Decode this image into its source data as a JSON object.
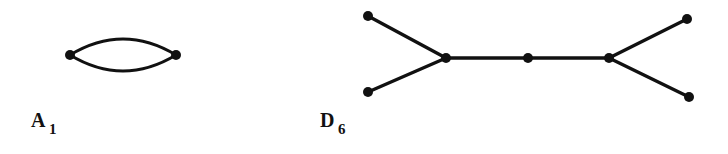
{
  "figure": {
    "background_color": "#ffffff",
    "ink_color": "#111111",
    "width": 728,
    "height": 154,
    "diagrams": [
      {
        "id": "a1",
        "label_base": "A",
        "label_subscript": "1",
        "label_text": "A1",
        "type": "lens-double-edge",
        "node_count": 2,
        "edge_count": 2,
        "nodes": [
          {
            "name": "a1-node-left",
            "x": 70,
            "y": 55
          },
          {
            "name": "a1-node-right",
            "x": 176,
            "y": 55
          }
        ],
        "edges": [
          {
            "name": "a1-edge-upper",
            "from": 0,
            "to": 1,
            "bow": -23
          },
          {
            "name": "a1-edge-lower",
            "from": 0,
            "to": 1,
            "bow": 23
          }
        ]
      },
      {
        "id": "d6",
        "label_base": "D",
        "label_subscript": "6",
        "label_text": "D6",
        "type": "tree",
        "node_count": 7,
        "edge_count": 6,
        "nodes": [
          {
            "name": "d6-node-upper-left",
            "x": 368,
            "y": 16
          },
          {
            "name": "d6-node-lower-left",
            "x": 368,
            "y": 92
          },
          {
            "name": "d6-node-left-fork",
            "x": 446,
            "y": 58
          },
          {
            "name": "d6-node-center",
            "x": 528,
            "y": 58
          },
          {
            "name": "d6-node-right-fork",
            "x": 609,
            "y": 58
          },
          {
            "name": "d6-node-upper-right",
            "x": 687,
            "y": 19
          },
          {
            "name": "d6-node-lower-right",
            "x": 689,
            "y": 97
          }
        ],
        "edges": [
          {
            "name": "d6-edge-upper-left",
            "from": 0,
            "to": 2
          },
          {
            "name": "d6-edge-lower-left",
            "from": 1,
            "to": 2
          },
          {
            "name": "d6-edge-left-middle",
            "from": 2,
            "to": 3
          },
          {
            "name": "d6-edge-middle-right",
            "from": 3,
            "to": 4
          },
          {
            "name": "d6-edge-upper-right",
            "from": 4,
            "to": 5
          },
          {
            "name": "d6-edge-lower-right",
            "from": 4,
            "to": 6
          }
        ]
      }
    ]
  }
}
